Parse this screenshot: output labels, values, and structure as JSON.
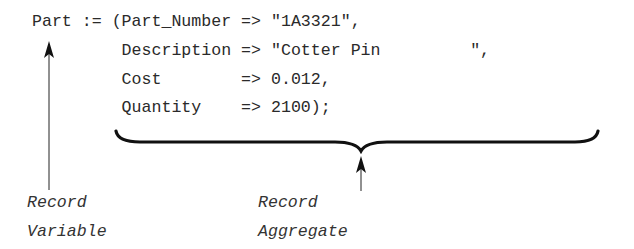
{
  "code": {
    "lines": [
      "Part := (Part_Number => \"1A3321\",",
      "         Description => \"Cotter Pin         \",",
      "         Cost        => 0.012,",
      "         Quantity    => 2100);"
    ]
  },
  "annotations": {
    "record_variable": {
      "line1": "Record",
      "line2": "Variable"
    },
    "record_aggregate": {
      "line1": "Record",
      "line2": "Aggregate"
    }
  },
  "colors": {
    "text": "#2a2a2a",
    "lines": "#111111",
    "background": "#ffffff"
  }
}
